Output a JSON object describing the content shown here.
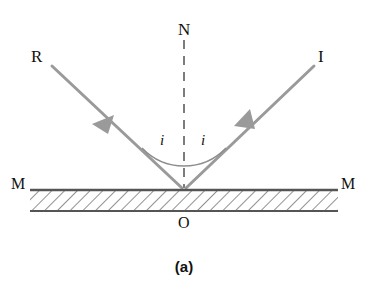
{
  "figure": {
    "caption": "(a)",
    "labels": {
      "incident_ray": "I",
      "reflected_ray": "R",
      "normal": "N",
      "mirror_left": "M",
      "mirror_right": "M",
      "origin": "O",
      "angle_incidence": "i",
      "angle_reflection": "i"
    },
    "colors": {
      "ray": "#9a9a9a",
      "normal": "#7d7d7d",
      "mirror": "#555555",
      "text": "#111111",
      "background": "#ffffff"
    },
    "geometry": {
      "point_of_incidence": [
        184,
        190
      ],
      "incident_start": [
        316,
        65
      ],
      "reflected_end": [
        48,
        65
      ],
      "normal_top": [
        184,
        38
      ],
      "mirror_left_end": [
        30,
        190
      ],
      "mirror_right_end": [
        338,
        190
      ]
    }
  }
}
